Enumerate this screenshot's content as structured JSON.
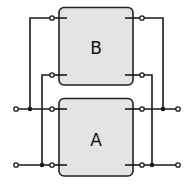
{
  "diagram": {
    "title": "",
    "blocks": [
      {
        "id": "B",
        "label": "B",
        "position": "top"
      },
      {
        "id": "A",
        "label": "A",
        "position": "bottom"
      }
    ],
    "colors": {
      "block_fill": "#e4e4e4",
      "line": "#1a1a1a",
      "background": "#ffffff"
    }
  }
}
